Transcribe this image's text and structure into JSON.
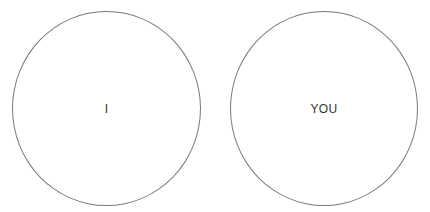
{
  "diagram": {
    "circles": [
      {
        "label": "I"
      },
      {
        "label": "YOU"
      }
    ],
    "stroke_color": "#7a7a7a",
    "text_color": "#333333"
  }
}
